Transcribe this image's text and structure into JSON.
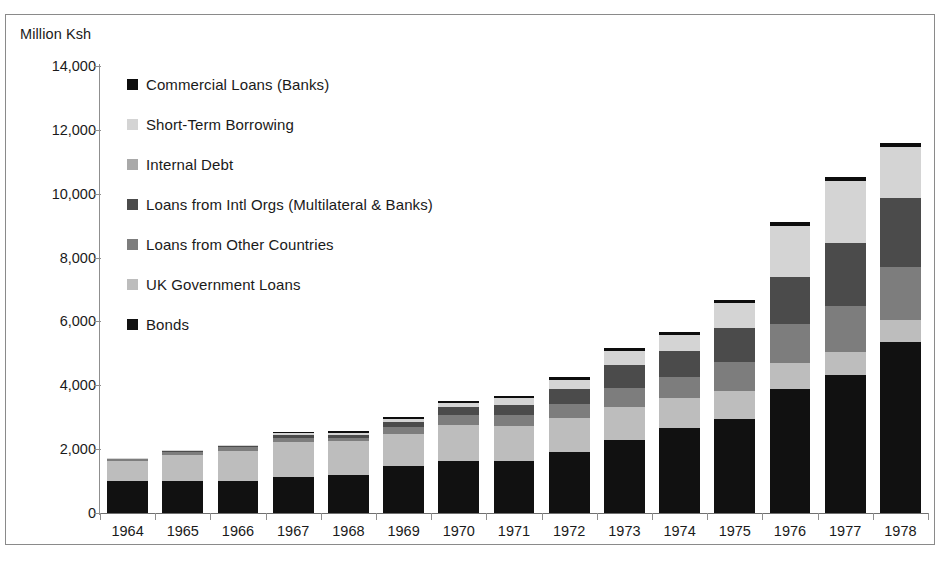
{
  "figure": {
    "unit_label": "Million Ksh",
    "source_caption": ""
  },
  "legend": {
    "items": [
      {
        "label": "Commercial Loans (Banks)",
        "color": "#0d0d0d",
        "key": "commercial_loans_banks"
      },
      {
        "label": "Short-Term Borrowing",
        "color": "#d4d4d4",
        "key": "short_term_borrowing"
      },
      {
        "label": "Internal Debt",
        "color": "#a9a9a9",
        "key": "internal_debt"
      },
      {
        "label": "Loans from Intl Orgs (Multilateral & Banks)",
        "color": "#4b4b4b",
        "key": "loans_intl_orgs"
      },
      {
        "label": "Loans from Other Countries",
        "color": "#7d7d7d",
        "key": "loans_other_countries"
      },
      {
        "label": "UK Government Loans",
        "color": "#bdbdbd",
        "key": "uk_government_loans"
      },
      {
        "label": "Bonds",
        "color": "#111111",
        "key": "bonds"
      }
    ]
  },
  "chart_data": {
    "type": "bar",
    "stacked": true,
    "title": "",
    "subtitle": "",
    "xlabel": "",
    "ylabel": "Million Ksh",
    "ylim": [
      0,
      14000
    ],
    "ytick_values": [
      0,
      2000,
      4000,
      6000,
      8000,
      10000,
      12000,
      14000
    ],
    "ytick_labels": [
      "0",
      "2,000",
      "4,000",
      "6,000",
      "8,000",
      "10,000",
      "12,000",
      "14,000"
    ],
    "grid": false,
    "legend_position": "inside-upper-left",
    "categories": [
      "1964",
      "1965",
      "1966",
      "1967",
      "1968",
      "1969",
      "1970",
      "1971",
      "1972",
      "1973",
      "1974",
      "1975",
      "1976",
      "1977",
      "1978"
    ],
    "series": [
      {
        "name": "Bonds",
        "color": "#111111",
        "values": [
          990,
          1000,
          1000,
          1140,
          1200,
          1480,
          1630,
          1630,
          1900,
          2300,
          2660,
          2960,
          3880,
          4310,
          5370
        ]
      },
      {
        "name": "UK Government Loans",
        "color": "#bdbdbd",
        "values": [
          640,
          820,
          950,
          1090,
          1050,
          980,
          1130,
          1110,
          1080,
          1010,
          930,
          860,
          810,
          730,
          690
        ]
      },
      {
        "name": "Loans from Other Countries",
        "color": "#7d7d7d",
        "values": [
          60,
          90,
          110,
          120,
          100,
          220,
          320,
          330,
          430,
          610,
          680,
          900,
          1230,
          1430,
          1640
        ]
      },
      {
        "name": "Loans from Intl Orgs (Multilateral & Banks)",
        "color": "#4b4b4b",
        "values": [
          30,
          40,
          50,
          90,
          100,
          160,
          230,
          300,
          470,
          720,
          810,
          1070,
          1470,
          1990,
          2170
        ]
      },
      {
        "name": "Internal Debt",
        "color": "#a9a9a9",
        "values": [
          0,
          0,
          0,
          0,
          0,
          0,
          0,
          0,
          0,
          0,
          0,
          0,
          0,
          0,
          0
        ]
      },
      {
        "name": "Short-Term Borrowing",
        "color": "#d4d4d4",
        "values": [
          10,
          20,
          30,
          60,
          70,
          110,
          140,
          240,
          300,
          440,
          490,
          780,
          1600,
          1930,
          1580
        ]
      },
      {
        "name": "Commercial Loans (Banks)",
        "color": "#0d0d0d",
        "values": [
          0,
          0,
          0,
          30,
          40,
          50,
          60,
          70,
          80,
          90,
          100,
          110,
          120,
          130,
          140
        ]
      }
    ],
    "totals": [
      1730,
      1970,
      2140,
      2530,
      2560,
      3000,
      3510,
      3680,
      4260,
      5170,
      5670,
      6680,
      9110,
      10520,
      11590
    ]
  }
}
